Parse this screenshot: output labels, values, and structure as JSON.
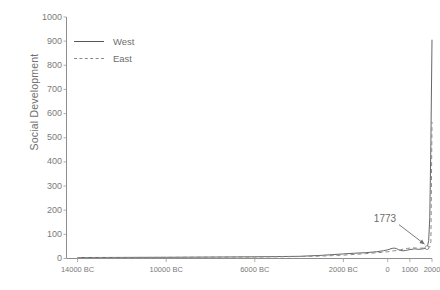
{
  "chart_data": {
    "type": "line",
    "title": "",
    "xlabel": "",
    "ylabel": "Social Development",
    "ylim": [
      0,
      1000
    ],
    "xlim": [
      -14500,
      2000
    ],
    "grid": false,
    "legend_position": "top-left",
    "ytick_labels": [
      "1000",
      "900",
      "800",
      "700",
      "600",
      "500",
      "400",
      "300",
      "200",
      "100",
      "0"
    ],
    "ytick_values": [
      1000,
      900,
      800,
      700,
      600,
      500,
      400,
      300,
      200,
      100,
      0
    ],
    "xtick_labels": [
      "14000 BC",
      "10000 BC",
      "6000 BC",
      "2000 BC",
      "0",
      "1000",
      "2000"
    ],
    "xtick_values": [
      -14000,
      -10000,
      -6000,
      -2000,
      0,
      1000,
      2000
    ],
    "annotations": [
      {
        "text": "1773",
        "x": 1773,
        "y": 45
      }
    ],
    "series": [
      {
        "name": "West",
        "style": "solid",
        "color": "#555555",
        "x": [
          -14000,
          -12000,
          -10000,
          -9000,
          -8000,
          -7000,
          -6000,
          -5000,
          -4000,
          -3500,
          -3000,
          -2500,
          -2000,
          -1500,
          -1000,
          -500,
          -200,
          0,
          100,
          200,
          300,
          400,
          500,
          600,
          700,
          800,
          900,
          1000,
          1100,
          1200,
          1300,
          1400,
          1500,
          1600,
          1700,
          1773,
          1800,
          1850,
          1900,
          1950,
          2000
        ],
        "y": [
          4,
          4.5,
          5,
          5.5,
          6,
          6.5,
          7,
          8,
          9,
          11,
          13,
          16,
          19,
          22,
          24,
          28,
          32,
          36,
          39,
          42,
          43,
          41,
          36,
          33,
          32,
          33,
          35,
          37,
          38,
          40,
          39,
          38,
          39,
          40,
          43,
          45,
          52,
          75,
          170,
          480,
          906
        ]
      },
      {
        "name": "East",
        "style": "dashed",
        "color": "#8a8a8a",
        "x": [
          -14000,
          -12000,
          -10000,
          -9000,
          -8000,
          -7000,
          -6000,
          -5000,
          -4000,
          -3500,
          -3000,
          -2500,
          -2000,
          -1500,
          -1000,
          -500,
          -200,
          0,
          100,
          200,
          300,
          400,
          500,
          600,
          700,
          800,
          900,
          1000,
          1100,
          1200,
          1300,
          1400,
          1500,
          1600,
          1700,
          1773,
          1800,
          1850,
          1900,
          1950,
          2000
        ],
        "y": [
          4,
          4.2,
          4.6,
          5,
          5.4,
          5.8,
          6.2,
          7,
          8,
          9,
          10,
          12,
          14,
          17,
          20,
          24,
          26,
          28,
          29,
          31,
          32,
          33,
          34,
          36,
          39,
          41,
          42,
          43,
          44,
          44,
          43,
          42,
          43,
          43,
          43,
          43,
          44,
          45,
          48,
          70,
          565
        ]
      }
    ]
  },
  "legend": {
    "items": [
      {
        "label": "West",
        "style": "solid"
      },
      {
        "label": "East",
        "style": "dashed"
      }
    ]
  },
  "axes": {
    "y_title": "Social Development"
  }
}
